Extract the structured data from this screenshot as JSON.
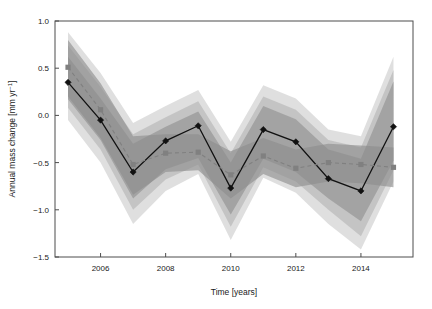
{
  "figure": {
    "background": "#ffffff",
    "frame_color": "#4d4d4d"
  },
  "axes": {
    "x": {
      "label": "Time [years]",
      "ticks": [
        2006,
        2008,
        2010,
        2012,
        2014
      ],
      "tick_labels": [
        "2006",
        "2008",
        "2010",
        "2012",
        "2014"
      ],
      "range": [
        2004.6,
        2015.6
      ]
    },
    "y": {
      "label_main": "Annual mass change [mm yr",
      "label_sup": "−1",
      "label_tail": "]",
      "label_full": "Annual mass change [mm yr⁻¹]",
      "ticks": [
        -1.5,
        -1.0,
        -0.5,
        0.0,
        0.5,
        1.0
      ],
      "tick_labels": [
        "−1.5",
        "−1.0",
        "−0.5",
        "0.0",
        "0.5",
        "1.0"
      ],
      "range": [
        -1.5,
        1.0
      ]
    }
  },
  "chart_data": {
    "type": "line",
    "title": "",
    "xlabel": "Time [years]",
    "ylabel": "Annual mass change [mm yr⁻¹]",
    "xlim": [
      2004.6,
      2015.6
    ],
    "ylim": [
      -1.5,
      1.0
    ],
    "grid": false,
    "legend": "none",
    "x": [
      2005,
      2006,
      2007,
      2008,
      2009,
      2010,
      2011,
      2012,
      2013,
      2014,
      2015
    ],
    "series": [
      {
        "name": "Annual mass change (solid)",
        "marker": "diamond",
        "linestyle": "solid",
        "color": "#111111",
        "values": [
          0.35,
          -0.05,
          -0.6,
          -0.27,
          -0.11,
          -0.77,
          -0.15,
          -0.28,
          -0.67,
          -0.8,
          -0.12
        ]
      },
      {
        "name": "Annual mass change (dashed)",
        "marker": "square",
        "linestyle": "dashed",
        "color": "#808080",
        "values": [
          0.51,
          0.06,
          -0.52,
          -0.4,
          -0.39,
          -0.63,
          -0.43,
          -0.56,
          -0.5,
          -0.52,
          -0.55
        ]
      }
    ],
    "uncertainty_bands": [
      {
        "name": "outer-band-light",
        "color": "#d9d9d9",
        "opacity": 0.85,
        "lower": [
          -0.05,
          -0.5,
          -1.15,
          -0.8,
          -0.62,
          -1.32,
          -0.66,
          -0.82,
          -1.15,
          -1.42,
          -0.7
        ],
        "upper": [
          0.88,
          0.45,
          -0.08,
          0.1,
          0.27,
          -0.28,
          0.32,
          0.18,
          -0.15,
          -0.22,
          0.62
        ]
      },
      {
        "name": "mid-band",
        "color": "#bfbfbf",
        "opacity": 0.85,
        "lower": [
          0.08,
          -0.36,
          -1.0,
          -0.68,
          -0.52,
          -1.18,
          -0.55,
          -0.7,
          -1.0,
          -1.28,
          -0.58
        ],
        "upper": [
          0.74,
          0.3,
          -0.2,
          -0.02,
          0.15,
          -0.4,
          0.2,
          0.06,
          -0.26,
          -0.34,
          0.48
        ]
      },
      {
        "name": "inner-band-dark",
        "color": "#9e9e9e",
        "opacity": 0.85,
        "lower": [
          0.17,
          -0.26,
          -0.88,
          -0.57,
          -0.45,
          -1.05,
          -0.46,
          -0.6,
          -0.88,
          -1.12,
          -0.48
        ],
        "upper": [
          0.62,
          0.18,
          -0.3,
          -0.12,
          0.04,
          -0.5,
          0.1,
          -0.04,
          -0.36,
          -0.46,
          0.36
        ]
      },
      {
        "name": "dashed-series-band",
        "color": "#8c8c8c",
        "opacity": 0.62,
        "lower": [
          0.2,
          -0.24,
          -0.84,
          -0.6,
          -0.58,
          -0.88,
          -0.62,
          -0.76,
          -0.7,
          -0.72,
          -0.76
        ],
        "upper": [
          0.8,
          0.34,
          -0.22,
          -0.2,
          -0.2,
          -0.38,
          -0.24,
          -0.36,
          -0.3,
          -0.32,
          -0.34
        ]
      }
    ]
  }
}
